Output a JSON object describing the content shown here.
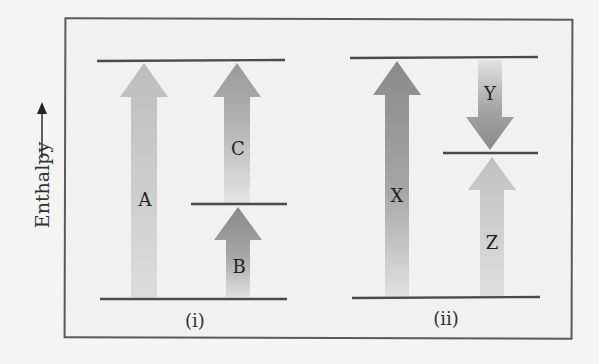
{
  "axis": {
    "label": "Enthalpy",
    "direction": "up"
  },
  "panels": [
    {
      "label": "(i)",
      "levels": [
        "top",
        "middle",
        "bottom"
      ],
      "arrows": [
        {
          "label": "A",
          "from": "bottom",
          "to": "top",
          "direction": "up",
          "shade": "light"
        },
        {
          "label": "B",
          "from": "bottom",
          "to": "middle",
          "direction": "up",
          "shade": "dark"
        },
        {
          "label": "C",
          "from": "middle",
          "to": "top",
          "direction": "up",
          "shade": "medium"
        }
      ]
    },
    {
      "label": "(ii)",
      "levels": [
        "top",
        "middle",
        "bottom"
      ],
      "arrows": [
        {
          "label": "X",
          "from": "bottom",
          "to": "top",
          "direction": "up",
          "shade": "dark"
        },
        {
          "label": "Y",
          "from": "top",
          "to": "middle",
          "direction": "down",
          "shade": "dark"
        },
        {
          "label": "Z",
          "from": "bottom",
          "to": "middle",
          "direction": "up",
          "shade": "light"
        }
      ]
    }
  ],
  "colors": {
    "frame": "#5a5a5a",
    "level_line": "#4a4a4a",
    "arrow_light": "#c4c4c4",
    "arrow_medium": "#a8a8a8",
    "arrow_dark": "#8e8e8e",
    "background": "#f1f1f0"
  }
}
